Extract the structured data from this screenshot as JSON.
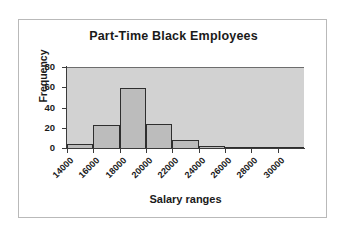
{
  "chart_data": {
    "type": "bar",
    "title": "Part-Time Black Employees",
    "xlabel": "Salary ranges",
    "ylabel": "Frequency",
    "categories": [
      "14000",
      "16000",
      "18000",
      "20000",
      "22000",
      "24000",
      "26000",
      "28000",
      "30000"
    ],
    "values": [
      5,
      24,
      60,
      25,
      9,
      3,
      1,
      0,
      1
    ],
    "ylim": [
      0,
      80
    ],
    "yticks": [
      0,
      20,
      40,
      60,
      80
    ],
    "grid": false,
    "legend": false,
    "colors": {
      "bar_fill": "#bcbcbc",
      "bar_outline": "#2e2e2e",
      "plot_background": "#d2d2d2",
      "frame_border": "#b9b9b9",
      "text": "#1a1a1a"
    }
  }
}
